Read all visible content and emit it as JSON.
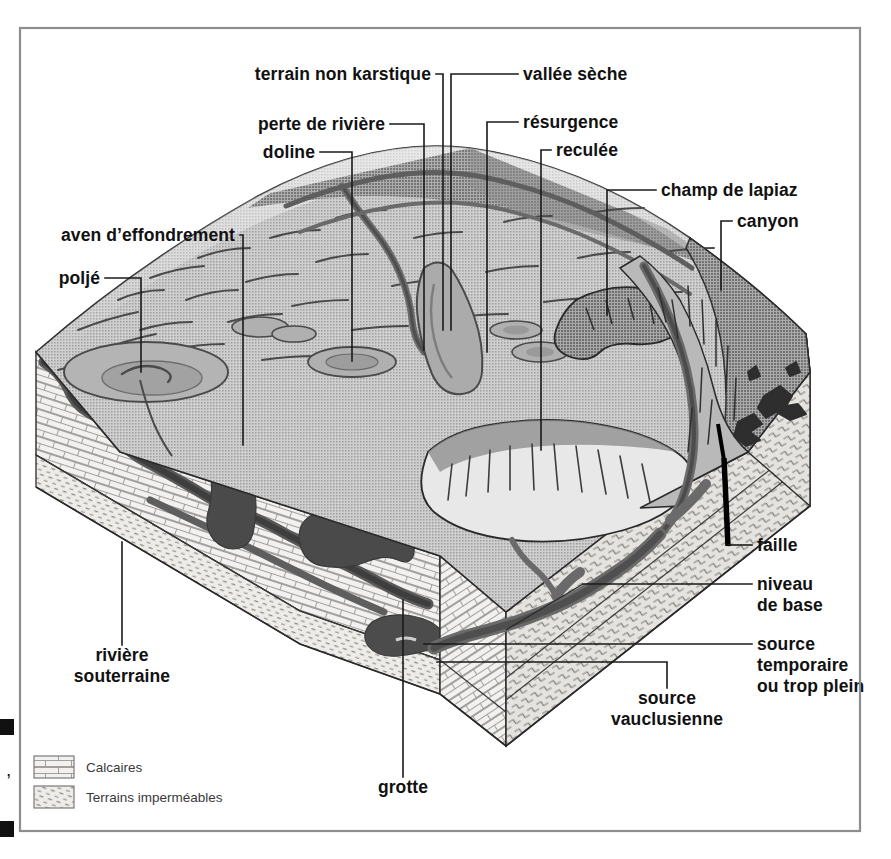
{
  "figure": {
    "type": "block-diagram",
    "language": "fr"
  },
  "labels": [
    {
      "id": "terrain-non-karstique",
      "text": "terrain non karstique",
      "align": "end",
      "tx": 431,
      "ty": 80,
      "leader": [
        [
          436,
          74
        ],
        [
          443,
          74
        ],
        [
          443,
          330
        ]
      ]
    },
    {
      "id": "vallee-seche",
      "text": "vallée sèche",
      "align": "start",
      "tx": 523,
      "ty": 80,
      "leader": [
        [
          518,
          74
        ],
        [
          451,
          74
        ],
        [
          451,
          330
        ]
      ]
    },
    {
      "id": "perte-de-riviere",
      "text": "perte de rivière",
      "align": "end",
      "tx": 385,
      "ty": 130,
      "leader": [
        [
          390,
          124
        ],
        [
          424,
          124
        ],
        [
          424,
          350
        ]
      ]
    },
    {
      "id": "resurgence",
      "text": "résurgence",
      "align": "start",
      "tx": 523,
      "ty": 128,
      "leader": [
        [
          518,
          122
        ],
        [
          487,
          122
        ],
        [
          487,
          352
        ]
      ]
    },
    {
      "id": "doline",
      "text": "doline",
      "align": "end",
      "tx": 315,
      "ty": 158,
      "leader": [
        [
          320,
          152
        ],
        [
          352,
          152
        ],
        [
          352,
          361
        ]
      ]
    },
    {
      "id": "reculee",
      "text": "reculée",
      "align": "start",
      "tx": 556,
      "ty": 156,
      "leader": [
        [
          551,
          150
        ],
        [
          541,
          150
        ],
        [
          541,
          450
        ]
      ]
    },
    {
      "id": "champ-de-lapiaz",
      "text": "champ de lapiaz",
      "align": "start",
      "tx": 661,
      "ty": 196,
      "leader": [
        [
          656,
          190
        ],
        [
          607,
          190
        ],
        [
          607,
          315
        ]
      ]
    },
    {
      "id": "canyon",
      "text": "canyon",
      "align": "start",
      "tx": 737,
      "ty": 227,
      "leader": [
        [
          732,
          221
        ],
        [
          721,
          221
        ],
        [
          721,
          290
        ]
      ]
    },
    {
      "id": "aven-deffondrement",
      "text": "aven d’effondrement",
      "align": "end",
      "tx": 235,
      "ty": 241,
      "leader": [
        [
          240,
          235
        ],
        [
          243,
          235
        ],
        [
          243,
          445
        ]
      ]
    },
    {
      "id": "polje",
      "text": "poljé",
      "align": "end",
      "tx": 100,
      "ty": 284,
      "leader": [
        [
          105,
          278
        ],
        [
          141,
          278
        ],
        [
          141,
          372
        ]
      ]
    },
    {
      "id": "faille",
      "text": "faille",
      "align": "start",
      "tx": 757,
      "ty": 551,
      "leader": [
        [
          752,
          545
        ],
        [
          728,
          545
        ]
      ]
    },
    {
      "id": "niveau-de-base",
      "text": "niveau",
      "align": "start",
      "tx": 757,
      "ty": 590,
      "leader": [
        [
          752,
          584
        ],
        [
          583,
          584
        ]
      ]
    },
    {
      "id": "niveau-de-base-2",
      "text": "de base",
      "align": "start",
      "tx": 757,
      "ty": 611,
      "leader": null
    },
    {
      "id": "source-temporaire",
      "text": "source",
      "align": "start",
      "tx": 757,
      "ty": 650,
      "leader": [
        [
          752,
          644
        ],
        [
          424,
          644
        ]
      ]
    },
    {
      "id": "source-temporaire-2",
      "text": "temporaire",
      "align": "start",
      "tx": 757,
      "ty": 671,
      "leader": null
    },
    {
      "id": "source-temporaire-3",
      "text": "ou trop plein",
      "align": "start",
      "tx": 757,
      "ty": 692,
      "leader": null
    },
    {
      "id": "riviere-souterraine",
      "text": "rivière",
      "align": "middle",
      "tx": 122,
      "ty": 661,
      "leader": [
        [
          122,
          645
        ],
        [
          122,
          542
        ]
      ]
    },
    {
      "id": "riviere-souterraine-2",
      "text": "souterraine",
      "align": "middle",
      "tx": 122,
      "ty": 682,
      "leader": null
    },
    {
      "id": "source-vauclusienne",
      "text": "source",
      "align": "middle",
      "tx": 667,
      "ty": 704,
      "leader": [
        [
          667,
          688
        ],
        [
          667,
          662
        ],
        [
          437,
          662
        ]
      ]
    },
    {
      "id": "source-vauclusienne-2",
      "text": "vauclusienne",
      "align": "middle",
      "tx": 667,
      "ty": 725,
      "leader": null
    },
    {
      "id": "grotte",
      "text": "grotte",
      "align": "middle",
      "tx": 403,
      "ty": 793,
      "leader": [
        [
          403,
          777
        ],
        [
          403,
          600
        ]
      ]
    }
  ],
  "legend": {
    "items": [
      {
        "id": "calcaires",
        "label": "Calcaires",
        "pattern": "brick-pattern"
      },
      {
        "id": "terrains-impermeables",
        "label": "Terrains imperméables",
        "pattern": "dot-pattern"
      }
    ]
  },
  "colors": {
    "plateau_top": "#bcbcbc",
    "plateau_shadow": "#969696",
    "limestone_face": "#f0efed",
    "impermeable_face": "#d6d4d0",
    "water_dark": "#5a5a5a",
    "cave_void": "#4e4e4e",
    "fault": "#000000",
    "outline": "#2a2a2a",
    "frame": "#8d8d8d",
    "label_text": "#111111",
    "legend_text": "#3a3a3a"
  },
  "frame": {
    "x": 20,
    "y": 28,
    "width": 840,
    "height": 803
  },
  "crop_marks": [
    {
      "x": 0,
      "y": 719,
      "w": 14,
      "h": 16
    },
    {
      "x": 0,
      "y": 821,
      "w": 14,
      "h": 16
    }
  ]
}
